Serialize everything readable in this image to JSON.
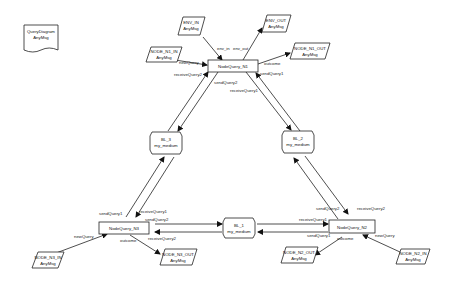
{
  "diagram": {
    "legend": {
      "line1": "QueryDiagram",
      "line2": "AnyMsg"
    },
    "nodes": {
      "n1": {
        "label": "NodeQuery_N1"
      },
      "n2": {
        "label": "NodeQuery_N2"
      },
      "n3": {
        "label": "NodeQuery_N3"
      }
    },
    "mediums": {
      "bl1": {
        "name": "BL_1",
        "type": "my_medium"
      },
      "bl2": {
        "name": "BL_2",
        "type": "my_medium"
      },
      "bl3": {
        "name": "BL_3",
        "type": "my_medium"
      }
    },
    "ports": {
      "env_in": {
        "name": "ENV_IN",
        "type": "AnyMsg"
      },
      "env_out": {
        "name": "ENV_OUT",
        "type": "AnyMsg"
      },
      "n1_in": {
        "name": "NODE_N1_IN",
        "type": "AnyMsg"
      },
      "n1_out": {
        "name": "NODE_N1_OUT",
        "type": "AnyMsg"
      },
      "n2_in": {
        "name": "NODE_N2_IN",
        "type": "AnyMsg"
      },
      "n2_out": {
        "name": "NODE_N2_OUT",
        "type": "AnyMsg"
      },
      "n3_in": {
        "name": "NODE_N3_IN",
        "type": "AnyMsg"
      },
      "n3_out": {
        "name": "NODE_N3_OUT",
        "type": "AnyMsg"
      }
    },
    "edge_labels": {
      "env_in": "env_in",
      "env_out": "env_out",
      "n1_newQuery": "newQuery",
      "n1_outcome": "outcome",
      "n1_receiveQuery2": "receiveQuery2",
      "n1_sendQuery2": "sendQuery2",
      "n1_sendQuery1": "sendQuery1",
      "n1_receiveQuery1": "receiveQuery1",
      "n3_sendQuery1": "sendQuery1",
      "n3_receiveQuery1": "receiveQuery1",
      "n3_sendQuery2": "sendQuery2",
      "n3_receiveQuery2": "receiveQuery2",
      "n3_newQuery": "newQuery",
      "n3_outcome": "outcome",
      "n2_sendQuery2": "sendQuery2",
      "n2_receiveQuery2": "receiveQuery2",
      "n2_receiveQuery1": "receiveQuery1",
      "n2_sendQuery1": "sendQuery1",
      "n2_newQuery": "newQuery",
      "n2_outcome": "outcome"
    }
  }
}
